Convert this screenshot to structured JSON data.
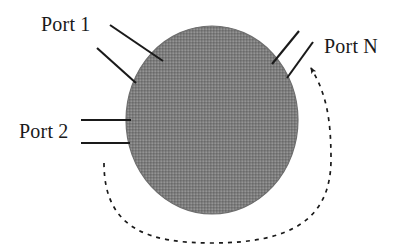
{
  "figure": {
    "type": "block-diagram",
    "background_color": "#ffffff",
    "stroke_color": "#1a1a1a"
  },
  "node": {
    "name": "shaded-circle",
    "shape": "circle",
    "fill_color": "#808080",
    "fill_pattern": "halftone-dither",
    "outline_color": "#6e6e6e",
    "center_x": 212,
    "center_y": 120,
    "radius_x": 86,
    "radius_y": 94
  },
  "labels": {
    "port_1": "Port 1",
    "port_2": "Port 2",
    "port_n": "Port N"
  },
  "connectors": [
    {
      "name": "port-1-line-upper",
      "port": "Port 1",
      "style": "solid",
      "x1": 110,
      "y1": 25,
      "x2": 163,
      "y2": 61
    },
    {
      "name": "port-1-line-lower",
      "port": "Port 1",
      "style": "solid",
      "x1": 97,
      "y1": 48,
      "x2": 136,
      "y2": 83
    },
    {
      "name": "port-2-line-upper",
      "port": "Port 2",
      "style": "solid",
      "x1": 81,
      "y1": 120,
      "x2": 131,
      "y2": 120
    },
    {
      "name": "port-2-line-lower",
      "port": "Port 2",
      "style": "solid",
      "x1": 81,
      "y1": 143,
      "x2": 130,
      "y2": 143
    },
    {
      "name": "port-n-line-left",
      "port": "Port N",
      "style": "solid",
      "x1": 272,
      "y1": 64,
      "x2": 299,
      "y2": 31
    },
    {
      "name": "port-n-line-right",
      "port": "Port N",
      "style": "solid",
      "x1": 287,
      "y1": 78,
      "x2": 313,
      "y2": 42
    }
  ],
  "feedback_arrow": {
    "name": "dashed-feedback-arrow",
    "style": "dashed",
    "dash_pattern": "4 5",
    "start_x": 104,
    "start_y": 163,
    "end_x": 308,
    "end_y": 62,
    "arrowhead": "filled-triangle",
    "path": "M 104 163 C 104 230, 150 243, 212 243 C 290 243, 330 220, 330 160 C 330 120, 327 95, 310 66"
  }
}
